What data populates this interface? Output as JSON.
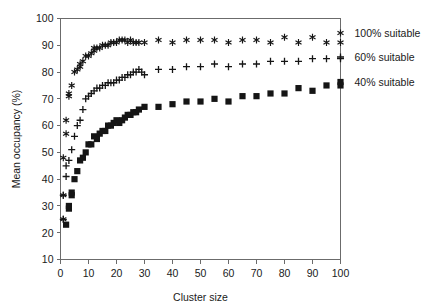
{
  "chart_data": {
    "type": "scatter",
    "title": "",
    "xlabel": "Cluster size",
    "ylabel": "Mean occupancy (%)",
    "xlim": [
      0,
      100
    ],
    "ylim": [
      10,
      100
    ],
    "xticks": [
      0,
      10,
      20,
      30,
      40,
      50,
      60,
      70,
      80,
      90,
      100
    ],
    "yticks": [
      10,
      20,
      30,
      40,
      50,
      60,
      70,
      80,
      90,
      100
    ],
    "xtick_labels": [
      "0",
      "10",
      "20",
      "30",
      "40",
      "50",
      "60",
      "70",
      "80",
      "90",
      "100"
    ],
    "ytick_labels": [
      "10",
      "20",
      "30",
      "40",
      "50",
      "60",
      "70",
      "80",
      "90",
      "100"
    ],
    "grid": false,
    "legend_position": "right-outside",
    "series": [
      {
        "name": "100% suitable",
        "marker": "asterisk",
        "color": "#151515",
        "points": [
          [
            2,
            57
          ],
          [
            2,
            62
          ],
          [
            3,
            71
          ],
          [
            3,
            72
          ],
          [
            4,
            75
          ],
          [
            5,
            80
          ],
          [
            6,
            81
          ],
          [
            7,
            82
          ],
          [
            7,
            83
          ],
          [
            8,
            84
          ],
          [
            9,
            86
          ],
          [
            10,
            86
          ],
          [
            11,
            87
          ],
          [
            12,
            88
          ],
          [
            12,
            89
          ],
          [
            13,
            89
          ],
          [
            14,
            89
          ],
          [
            15,
            90
          ],
          [
            16,
            90
          ],
          [
            17,
            90
          ],
          [
            18,
            91
          ],
          [
            19,
            91
          ],
          [
            20,
            91
          ],
          [
            21,
            92
          ],
          [
            22,
            92
          ],
          [
            23,
            92
          ],
          [
            24,
            91
          ],
          [
            25,
            92
          ],
          [
            26,
            91
          ],
          [
            27,
            91
          ],
          [
            28,
            91
          ],
          [
            30,
            91
          ],
          [
            35,
            92
          ],
          [
            40,
            91
          ],
          [
            45,
            92
          ],
          [
            50,
            92
          ],
          [
            55,
            92
          ],
          [
            60,
            91
          ],
          [
            65,
            92
          ],
          [
            70,
            92
          ],
          [
            75,
            91
          ],
          [
            80,
            93
          ],
          [
            85,
            91
          ],
          [
            90,
            93
          ],
          [
            95,
            91
          ],
          [
            100,
            91
          ],
          [
            1,
            34
          ],
          [
            1,
            25
          ],
          [
            1,
            48
          ]
        ]
      },
      {
        "name": "60% suitable",
        "marker": "plus",
        "color": "#151515",
        "points": [
          [
            2,
            41
          ],
          [
            2,
            45
          ],
          [
            3,
            47
          ],
          [
            4,
            51
          ],
          [
            5,
            56
          ],
          [
            6,
            60
          ],
          [
            7,
            62
          ],
          [
            8,
            66
          ],
          [
            9,
            70
          ],
          [
            10,
            71
          ],
          [
            11,
            72
          ],
          [
            12,
            73
          ],
          [
            13,
            74
          ],
          [
            14,
            74
          ],
          [
            15,
            75
          ],
          [
            16,
            75
          ],
          [
            17,
            76
          ],
          [
            18,
            76
          ],
          [
            19,
            76
          ],
          [
            20,
            77
          ],
          [
            21,
            77
          ],
          [
            22,
            78
          ],
          [
            23,
            78
          ],
          [
            24,
            79
          ],
          [
            25,
            79
          ],
          [
            26,
            80
          ],
          [
            27,
            80
          ],
          [
            28,
            81
          ],
          [
            29,
            80
          ],
          [
            30,
            79
          ],
          [
            35,
            81
          ],
          [
            40,
            81
          ],
          [
            45,
            82
          ],
          [
            50,
            82
          ],
          [
            55,
            83
          ],
          [
            60,
            82
          ],
          [
            65,
            83
          ],
          [
            70,
            83
          ],
          [
            75,
            84
          ],
          [
            80,
            84
          ],
          [
            85,
            84
          ],
          [
            90,
            85
          ],
          [
            95,
            85
          ],
          [
            100,
            85
          ],
          [
            1,
            34
          ],
          [
            1,
            25
          ]
        ]
      },
      {
        "name": "40% suitable",
        "marker": "square",
        "color": "#151515",
        "points": [
          [
            2,
            23
          ],
          [
            3,
            29
          ],
          [
            3,
            30
          ],
          [
            4,
            34
          ],
          [
            4,
            35
          ],
          [
            5,
            40
          ],
          [
            6,
            43
          ],
          [
            7,
            47
          ],
          [
            8,
            48
          ],
          [
            9,
            50
          ],
          [
            10,
            53
          ],
          [
            11,
            53
          ],
          [
            12,
            56
          ],
          [
            13,
            55
          ],
          [
            14,
            57
          ],
          [
            15,
            58
          ],
          [
            16,
            58
          ],
          [
            17,
            60
          ],
          [
            18,
            60
          ],
          [
            19,
            61
          ],
          [
            20,
            62
          ],
          [
            21,
            61
          ],
          [
            22,
            62
          ],
          [
            23,
            63
          ],
          [
            24,
            64
          ],
          [
            25,
            64
          ],
          [
            26,
            65
          ],
          [
            27,
            65
          ],
          [
            28,
            66
          ],
          [
            30,
            67
          ],
          [
            35,
            67
          ],
          [
            40,
            68
          ],
          [
            45,
            69
          ],
          [
            50,
            69
          ],
          [
            55,
            70
          ],
          [
            60,
            69
          ],
          [
            65,
            71
          ],
          [
            70,
            71
          ],
          [
            75,
            72
          ],
          [
            80,
            72
          ],
          [
            85,
            74
          ],
          [
            90,
            73
          ],
          [
            95,
            75
          ],
          [
            100,
            75
          ]
        ]
      }
    ]
  },
  "legend": {
    "items": [
      {
        "label": "100% suitable",
        "marker": "asterisk"
      },
      {
        "label": "60% suitable",
        "marker": "plus"
      },
      {
        "label": "40% suitable",
        "marker": "square"
      }
    ]
  }
}
